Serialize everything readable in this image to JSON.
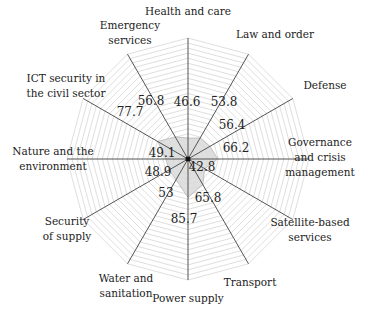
{
  "chart_data": {
    "type": "radar",
    "title": "",
    "categories": [
      "Health and care",
      "Law and order",
      "Defense",
      "Governance and crisis management",
      "Satellite-based services",
      "Transport",
      "Power supply",
      "Water and sanitation",
      "Security of supply",
      "Nature and the environment",
      "ICT security in the civil sector",
      "Emergency services"
    ],
    "category_label_lines": [
      [
        "Health and care"
      ],
      [
        "Law and order"
      ],
      [
        "Defense"
      ],
      [
        "Governance",
        "and crisis",
        "management"
      ],
      [
        "Satellite-based",
        "services"
      ],
      [
        "Transport"
      ],
      [
        "Power supply"
      ],
      [
        "Water and",
        "sanitation"
      ],
      [
        "Security",
        "of supply"
      ],
      [
        "Nature and the",
        "environment"
      ],
      [
        "ICT security in",
        "the civil sector"
      ],
      [
        "Emergency",
        "services"
      ]
    ],
    "values": [
      46.6,
      53.8,
      56.4,
      66.2,
      42.8,
      65.8,
      85.7,
      53,
      48.9,
      49.1,
      77.7,
      56.8
    ],
    "value_labels": [
      "46.6",
      "53.8",
      "56.4",
      "66.2",
      "42.8",
      "65.8",
      "85.7",
      "53",
      "48.9",
      "49.1",
      "77.7",
      "56.8"
    ],
    "axis_angles_deg": [
      90,
      60,
      30,
      0,
      -30,
      -60,
      -90,
      -120,
      -150,
      180,
      150,
      120
    ],
    "grid": true,
    "grid_rings": 24,
    "legend": false,
    "colors": {
      "axis": "#555555",
      "grid": "#c8c8c8",
      "fill": "#d9d9d9",
      "fill_stroke": "#b5b5b5",
      "text": "#222222"
    }
  }
}
